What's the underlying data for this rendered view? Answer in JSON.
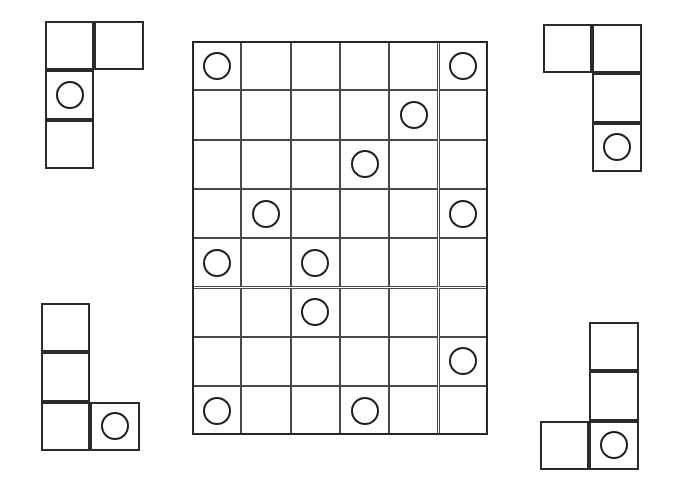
{
  "canvas": {
    "width": 681,
    "height": 492,
    "background": "#ffffff"
  },
  "style": {
    "cell_size": 49.3,
    "token_diameter": 28,
    "grid_line_color": "#4a4a4a",
    "board_frame_color": "#262626",
    "piece_line_color": "#2b2b2b",
    "token_color": "#1e1e1e"
  },
  "board": {
    "label": "Main puzzle board",
    "origin": {
      "x": 192,
      "y": 41
    },
    "columns": 6,
    "rows": 8,
    "tokens": [
      {
        "row": 0,
        "col": 0
      },
      {
        "row": 0,
        "col": 5
      },
      {
        "row": 1,
        "col": 4
      },
      {
        "row": 2,
        "col": 3
      },
      {
        "row": 3,
        "col": 1
      },
      {
        "row": 3,
        "col": 5
      },
      {
        "row": 4,
        "col": 0
      },
      {
        "row": 4,
        "col": 2
      },
      {
        "row": 5,
        "col": 2
      },
      {
        "row": 6,
        "col": 5
      },
      {
        "row": 7,
        "col": 0
      },
      {
        "row": 7,
        "col": 3
      }
    ],
    "token_count": 12
  },
  "pieces": [
    {
      "id": "piece-top-left",
      "label": "Top-left L piece",
      "origin": {
        "x": 45,
        "y": 21
      },
      "columns": 2,
      "rows": 3,
      "cells": [
        {
          "row": 0,
          "col": 0
        },
        {
          "row": 0,
          "col": 1
        },
        {
          "row": 1,
          "col": 0
        },
        {
          "row": 2,
          "col": 0
        }
      ],
      "tokens": [
        {
          "row": 1,
          "col": 0
        }
      ],
      "cell_count": 4,
      "token_count": 1
    },
    {
      "id": "piece-top-right",
      "label": "Top-right J piece",
      "origin": {
        "x": 543,
        "y": 24
      },
      "columns": 2,
      "rows": 3,
      "cells": [
        {
          "row": 0,
          "col": 0
        },
        {
          "row": 0,
          "col": 1
        },
        {
          "row": 1,
          "col": 1
        },
        {
          "row": 2,
          "col": 1
        }
      ],
      "tokens": [
        {
          "row": 2,
          "col": 1
        }
      ],
      "cell_count": 4,
      "token_count": 1
    },
    {
      "id": "piece-bottom-left",
      "label": "Bottom-left L piece",
      "origin": {
        "x": 41,
        "y": 303
      },
      "columns": 2,
      "rows": 3,
      "cells": [
        {
          "row": 0,
          "col": 0
        },
        {
          "row": 1,
          "col": 0
        },
        {
          "row": 2,
          "col": 0
        },
        {
          "row": 2,
          "col": 1
        }
      ],
      "tokens": [
        {
          "row": 2,
          "col": 1
        }
      ],
      "cell_count": 4,
      "token_count": 1
    },
    {
      "id": "piece-bottom-right",
      "label": "Bottom-right J piece",
      "origin": {
        "x": 540,
        "y": 322
      },
      "columns": 2,
      "rows": 3,
      "cells": [
        {
          "row": 0,
          "col": 1
        },
        {
          "row": 1,
          "col": 1
        },
        {
          "row": 2,
          "col": 0
        },
        {
          "row": 2,
          "col": 1
        }
      ],
      "tokens": [
        {
          "row": 2,
          "col": 1
        }
      ],
      "cell_count": 4,
      "token_count": 1
    }
  ]
}
